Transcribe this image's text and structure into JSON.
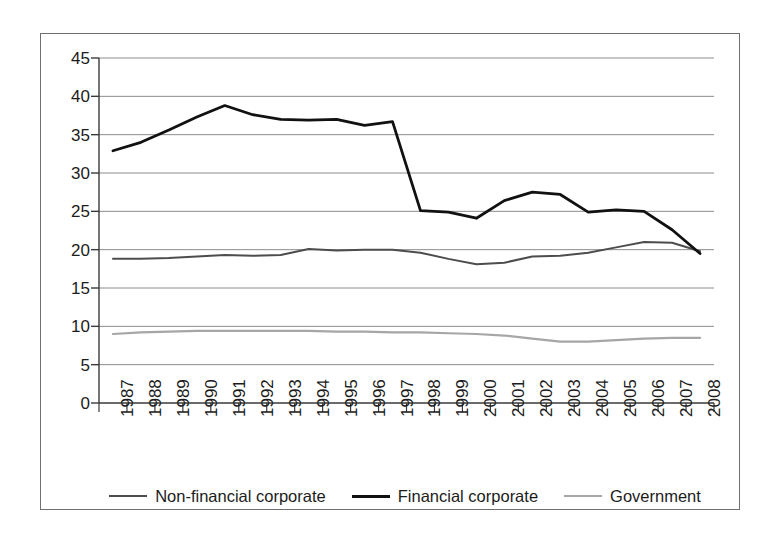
{
  "chart_data": {
    "type": "line",
    "title": "",
    "subtitle": "",
    "xlabel": "",
    "ylabel": "",
    "xlim_categories": 22,
    "ylim": [
      0,
      45
    ],
    "ytick_step": 5,
    "yticks": [
      0,
      5,
      10,
      15,
      20,
      25,
      30,
      35,
      40,
      45
    ],
    "grid": "horizontal",
    "legend_position": "bottom",
    "categories": [
      "1987",
      "1988",
      "1989",
      "1990",
      "1991",
      "1992",
      "1993",
      "1994",
      "1995",
      "1996",
      "1997",
      "1998",
      "1999",
      "2000",
      "2001",
      "2002",
      "2003",
      "2004",
      "2005",
      "2006",
      "2007",
      "2008"
    ],
    "series": [
      {
        "name": "Non-financial corporate",
        "color": "#4d4d4d",
        "width": 2.0,
        "values": [
          18.8,
          18.8,
          18.9,
          19.1,
          19.3,
          19.2,
          19.3,
          20.1,
          19.9,
          20.0,
          20.0,
          19.6,
          18.8,
          18.1,
          18.3,
          19.1,
          19.2,
          19.6,
          20.3,
          21.0,
          20.9,
          19.8
        ]
      },
      {
        "name": "Financial corporate",
        "color": "#111111",
        "width": 2.8,
        "values": [
          32.9,
          34.0,
          35.6,
          37.3,
          38.8,
          37.6,
          37.0,
          36.9,
          37.0,
          36.2,
          36.7,
          25.1,
          24.9,
          24.1,
          26.4,
          27.5,
          27.2,
          24.9,
          25.2,
          25.0,
          22.6,
          19.5
        ]
      },
      {
        "name": "Government",
        "color": "#a6a6a6",
        "width": 2.2,
        "values": [
          9.0,
          9.2,
          9.3,
          9.4,
          9.4,
          9.4,
          9.4,
          9.4,
          9.3,
          9.3,
          9.2,
          9.2,
          9.1,
          9.0,
          8.8,
          8.4,
          8.0,
          8.0,
          8.2,
          8.4,
          8.5,
          8.5
        ]
      }
    ]
  },
  "legend": {
    "items": [
      {
        "label": "Non-financial corporate",
        "color": "#4d4d4d",
        "width": 2.0
      },
      {
        "label": "Financial corporate",
        "color": "#111111",
        "width": 3.0
      },
      {
        "label": "Government",
        "color": "#a6a6a6",
        "width": 2.2
      }
    ]
  },
  "axes": {
    "y_tick_labels": [
      "45",
      "40",
      "35",
      "30",
      "25",
      "20",
      "15",
      "10",
      "5",
      "0"
    ],
    "x_tick_labels": [
      "1987",
      "1988",
      "1989",
      "1990",
      "1991",
      "1992",
      "1993",
      "1994",
      "1995",
      "1996",
      "1997",
      "1998",
      "1999",
      "2000",
      "2001",
      "2002",
      "2003",
      "2004",
      "2005",
      "2006",
      "2007",
      "2008"
    ]
  },
  "style": {
    "frame_color": "#6f6f6f",
    "axis_color": "#3a3a3a",
    "grid_color": "#8c8c8c",
    "background": "#ffffff"
  }
}
